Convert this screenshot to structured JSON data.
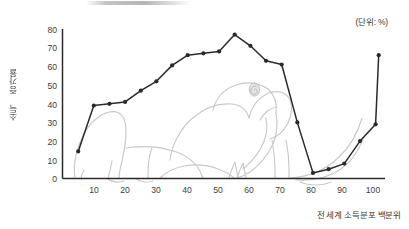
{
  "annotations": {
    "unit_note": "(단위: %)"
  },
  "axes": {
    "y_title": "소득 증가율",
    "x_title": "전 세계 소득분포 백분위",
    "y_ticks": [
      "0",
      "10",
      "20",
      "30",
      "40",
      "50",
      "60",
      "70",
      "80"
    ],
    "x_ticks": [
      "10",
      "20",
      "30",
      "40",
      "50",
      "60",
      "70",
      "80",
      "90",
      "100"
    ]
  },
  "decoration": {
    "elephant_silhouette": "elephant-outline",
    "elephant_color": "#c9c9c9"
  },
  "chart_data": {
    "type": "line",
    "title": "",
    "subtitle": "",
    "xlabel": "전 세계 소득분포 백분위",
    "ylabel": "소득 증가율",
    "unit": "%",
    "xlim": [
      0,
      103
    ],
    "ylim": [
      0,
      80
    ],
    "grid": false,
    "legend": "none",
    "line_color": "#2a2a2a",
    "marker": "circle",
    "x": [
      5,
      10,
      15,
      20,
      25,
      30,
      35,
      40,
      45,
      50,
      55,
      60,
      65,
      70,
      75,
      80,
      85,
      90,
      95,
      100
    ],
    "series": [
      {
        "name": "소득 증가율",
        "values": [
          14.5,
          39,
          40,
          41,
          47,
          52,
          60.5,
          66,
          67,
          68,
          77,
          71,
          63,
          61,
          30,
          3,
          5,
          8,
          20,
          29
        ]
      }
    ],
    "extra_points": [
      {
        "x": 101,
        "y": 66
      }
    ],
    "x_ticks": [
      10,
      20,
      30,
      40,
      50,
      60,
      70,
      80,
      90,
      100
    ],
    "y_ticks": [
      0,
      10,
      20,
      30,
      40,
      50,
      60,
      70,
      80
    ]
  }
}
